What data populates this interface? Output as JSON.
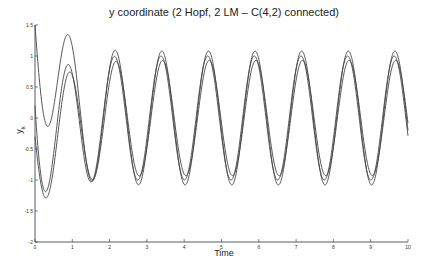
{
  "chart_data": {
    "type": "line",
    "title": "y coordinate (2 Hopf, 2 LM – C(4,2) connected)",
    "xlabel": "Time",
    "ylabel": "y_k",
    "xlim": [
      0,
      10
    ],
    "ylim": [
      -2,
      1.5
    ],
    "xticks": [
      0,
      1,
      2,
      3,
      4,
      5,
      6,
      7,
      8,
      9,
      10
    ],
    "yticks": [
      -2,
      -1.5,
      -1,
      -0.5,
      0,
      0.5,
      1,
      1.5
    ],
    "ytick_labels": [
      "-2",
      "-1.5",
      "-1",
      "-0.5",
      "0",
      "0.5",
      "1",
      "1.5"
    ],
    "grid": false,
    "legend": null,
    "line_color": "#444444",
    "series": [
      {
        "name": "y_1",
        "amplitude": 1.08,
        "period": 1.25,
        "phase_peak": 0.9,
        "initial": 1.5,
        "initial_min": -0.6,
        "transient_tau": 0.35
      },
      {
        "name": "y_2",
        "amplitude": 0.93,
        "period": 1.25,
        "phase_peak": 0.92,
        "initial": -0.3,
        "initial_min": -1.25,
        "transient_tau": 0.4
      },
      {
        "name": "y_3",
        "amplitude": 1.0,
        "period": 1.25,
        "phase_peak": 0.88,
        "initial": 0.2,
        "initial_min": -1.62,
        "transient_tau": 0.3
      }
    ]
  }
}
